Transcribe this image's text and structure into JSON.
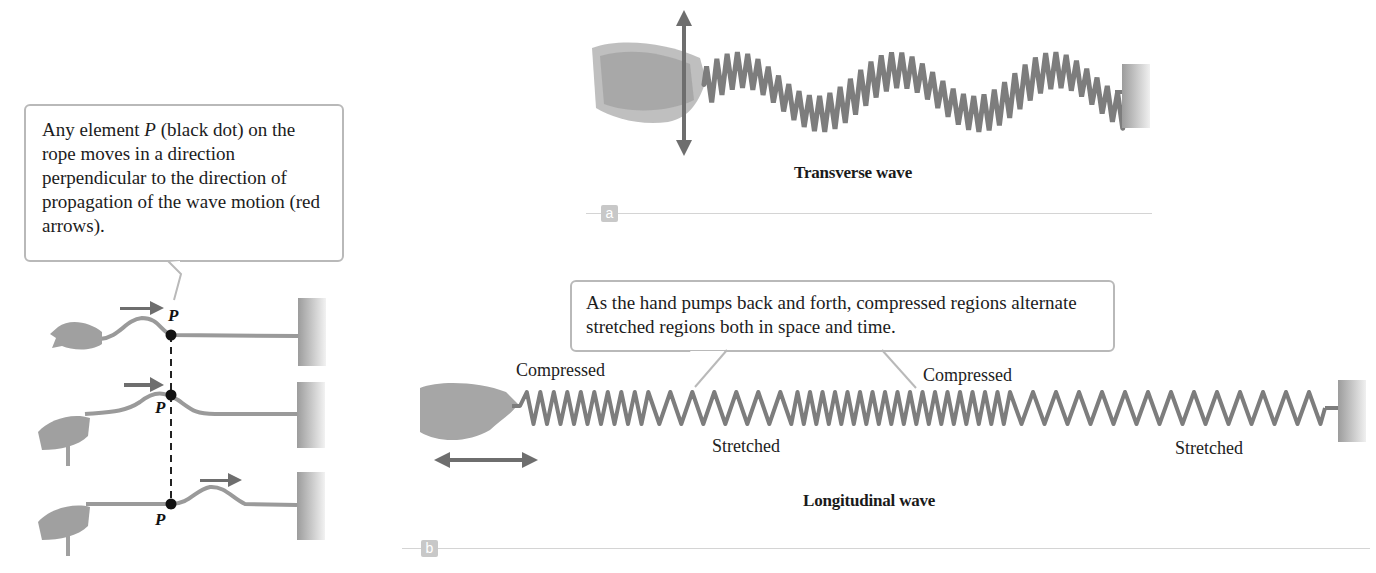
{
  "figure": {
    "left_panel": {
      "callout_text_parts": [
        "Any element ",
        "P",
        " (black dot) on the rope moves in a direction perpendicular to the direction of propagation of the wave motion (red arrows)."
      ],
      "point_label": "P",
      "rows": 3
    },
    "panel_a": {
      "tag": "a",
      "caption": "Transverse wave"
    },
    "panel_b": {
      "tag": "b",
      "caption": "Longitudinal wave",
      "callout_text": "As the hand pumps back and forth, compressed regions alternate stretched regions both in space and time.",
      "labels": {
        "compressed_1": "Compressed",
        "compressed_2": "Compressed",
        "stretched_1": "Stretched",
        "stretched_2": "Stretched"
      }
    },
    "colors": {
      "rope": "#9a9a9a",
      "spring": "#7d7d7d",
      "arrow": "#6e6e6e",
      "wall": "#a8a8a8",
      "hand": "#a0a0a0",
      "callout_border": "#b9b9b9",
      "tag_bg": "#c8c8c8"
    }
  }
}
